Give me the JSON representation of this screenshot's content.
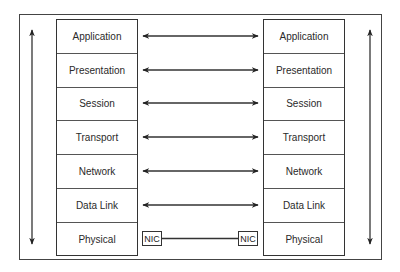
{
  "diagram": {
    "type": "OSI reference model peer communication",
    "left_stack": {
      "layers": [
        "Application",
        "Presentation",
        "Session",
        "Transport",
        "Network",
        "Data Link",
        "Physical"
      ]
    },
    "right_stack": {
      "layers": [
        "Application",
        "Presentation",
        "Session",
        "Transport",
        "Network",
        "Data Link",
        "Physical"
      ]
    },
    "peer_links": [
      {
        "layer": "Application",
        "style": "double-arrow"
      },
      {
        "layer": "Presentation",
        "style": "double-arrow"
      },
      {
        "layer": "Session",
        "style": "double-arrow"
      },
      {
        "layer": "Transport",
        "style": "double-arrow"
      },
      {
        "layer": "Network",
        "style": "double-arrow"
      },
      {
        "layer": "Data Link",
        "style": "double-arrow"
      },
      {
        "layer": "Physical",
        "style": "physical-link"
      }
    ],
    "nic": {
      "left_label": "NIC",
      "right_label": "NIC"
    },
    "vertical_flows": {
      "left": "up-and-down",
      "right": "up-and-down"
    },
    "colors": {
      "line": "#333333",
      "background": "#ffffff"
    }
  }
}
